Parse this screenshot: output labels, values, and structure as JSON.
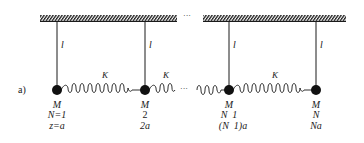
{
  "figure": {
    "panel_label": "a)",
    "ellipsis": "···",
    "ink_color": "#1a1a1a",
    "pendulum_length_label": "l",
    "spring_label": "K",
    "masses": [
      {
        "mass_label": "M",
        "index_label": "N=1",
        "position_label": "z=a"
      },
      {
        "mass_label": "M",
        "index_label": "2",
        "position_label": "2a"
      },
      {
        "mass_label": "M",
        "index_label": "N  1",
        "position_label": "(N  1)a"
      },
      {
        "mass_label": "M",
        "index_label": "N",
        "position_label": "Na"
      }
    ]
  }
}
